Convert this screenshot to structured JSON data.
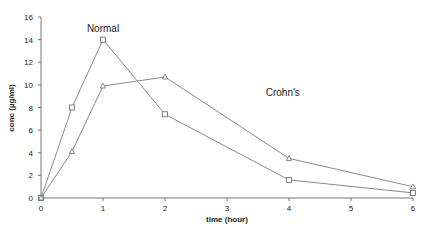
{
  "chart_data": {
    "type": "line",
    "title": "",
    "xlabel": "time (hour)",
    "ylabel": "conc (µg/ml)",
    "xlim": [
      0,
      6
    ],
    "ylim": [
      0,
      16
    ],
    "xticks": [
      0,
      1,
      2,
      3,
      4,
      5,
      6
    ],
    "yticks": [
      0,
      2,
      4,
      6,
      8,
      10,
      12,
      14,
      16
    ],
    "grid": false,
    "legend": "none (inline annotations)",
    "series": [
      {
        "name": "Normal",
        "marker": "square",
        "color": "#8a8a8a",
        "x": [
          0,
          0.5,
          1,
          2,
          4,
          6
        ],
        "y": [
          0,
          8.0,
          14.0,
          7.4,
          1.6,
          0.45
        ]
      },
      {
        "name": "Crohn's",
        "marker": "triangle",
        "color": "#8a8a8a",
        "x": [
          0,
          0.5,
          1,
          2,
          4,
          6
        ],
        "y": [
          0,
          4.1,
          9.9,
          10.7,
          3.5,
          1.0
        ]
      }
    ],
    "annotations": [
      {
        "text": "Normal",
        "x": 1.0,
        "y": 15.0
      },
      {
        "text": "Crohn's",
        "x": 3.9,
        "y": 9.4
      }
    ]
  }
}
